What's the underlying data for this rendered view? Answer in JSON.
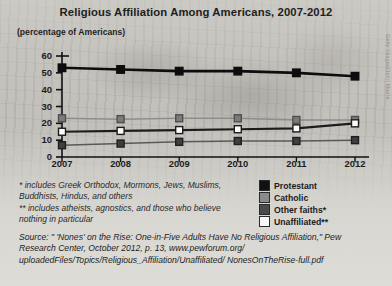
{
  "chart_data": {
    "type": "line",
    "title": "Religious Affiliation Among Americans, 2007-2012",
    "subtitle": "(percentage of Americans)",
    "xlabel": "",
    "ylabel": "",
    "categories": [
      "2007",
      "2008",
      "2009",
      "2010",
      "2011",
      "2012"
    ],
    "ylim": [
      0,
      60
    ],
    "yticks": [
      0,
      10,
      20,
      30,
      40,
      50,
      60
    ],
    "grid": false,
    "legend_position": "bottom-right",
    "series": [
      {
        "name": "Protestant",
        "values": [
          53,
          52,
          51,
          51,
          50,
          48
        ],
        "color": "#111111",
        "marker": "square-filled-black"
      },
      {
        "name": "Catholic",
        "values": [
          23,
          22.5,
          23,
          23,
          22,
          22
        ],
        "color": "#6e6e6e",
        "marker": "square-filled-gray"
      },
      {
        "name": "Other faiths*",
        "values": [
          15,
          15.5,
          16,
          16.5,
          17,
          20
        ],
        "color": "#ffffff",
        "marker": "square-open-white"
      },
      {
        "name": "Unaffiliated**",
        "values": [
          7,
          8,
          9,
          9.5,
          9.5,
          10
        ],
        "color": "#3d3d3d",
        "marker": "square-filled-darkgray"
      }
    ]
  },
  "legend": {
    "items": [
      {
        "label": "Protestant",
        "color": "#111111"
      },
      {
        "label": "Catholic",
        "color": "#8a8a8a"
      },
      {
        "label": "Other faiths*",
        "color": "#4a4a4a"
      },
      {
        "label": "Unaffiliated**",
        "color": "#f7f7f4"
      }
    ]
  },
  "footnotes": {
    "first": "* includes Greek Orthodox, Mormons, Jews, Muslims, Buddhists, Hindus, and others",
    "second": "** includes atheists, agnostics, and those who believe nothing in particular"
  },
  "source": "Source: \" 'Nones' on the Rise: One-in-Five Adults Have No Religious Affiliation,\" Pew Research Center, October 2012, p. 13, www.pewforum.org/ uploadedFiles/Topics/Religious_Affiliation/Unaffiliated/ NonesOnTheRise-full.pdf",
  "photo_credit": "Getty Images/John Moore"
}
